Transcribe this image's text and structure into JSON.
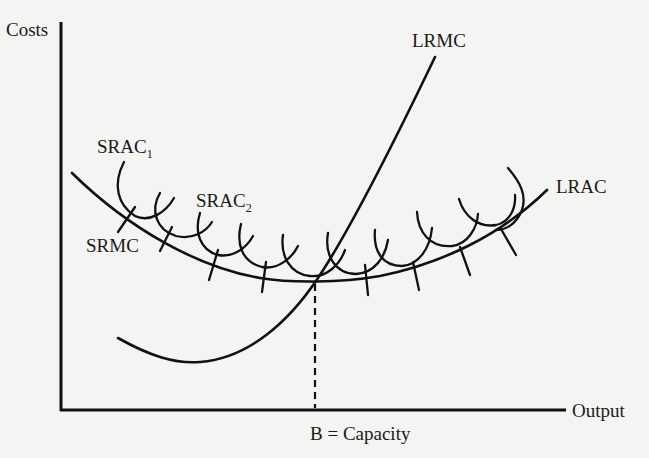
{
  "diagram": {
    "axes": {
      "y_label": "Costs",
      "x_label": "Output"
    },
    "curves": {
      "lrmc": {
        "label": "LRMC"
      },
      "lrac": {
        "label": "LRAC"
      },
      "srac1": {
        "label": "SRAC",
        "subscript": "1"
      },
      "srac2": {
        "label": "SRAC",
        "subscript": "2"
      },
      "srmc": {
        "label": "SRMC"
      }
    },
    "marker": {
      "label": "B = Capacity"
    },
    "colors": {
      "ink": "#111111",
      "paper": "#f4f4f2"
    }
  }
}
